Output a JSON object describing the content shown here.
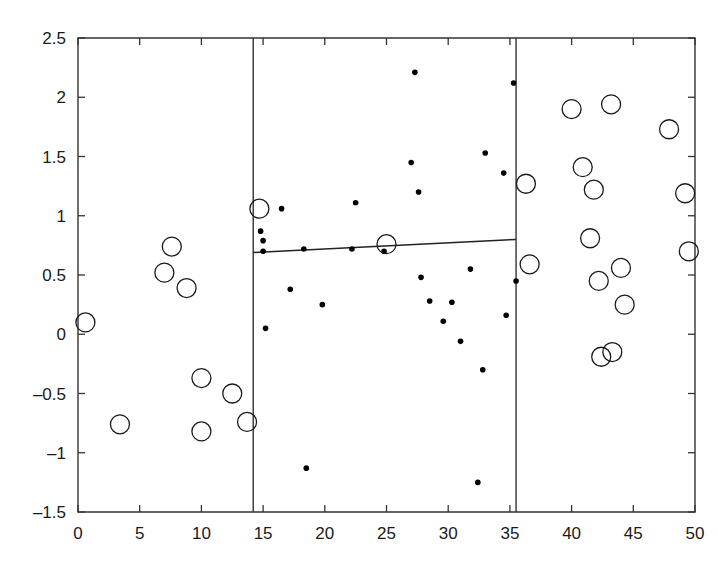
{
  "chart_data": {
    "type": "scatter",
    "title": "",
    "xlabel": "",
    "ylabel": "",
    "xlim": [
      0,
      50
    ],
    "ylim": [
      -1.5,
      2.5
    ],
    "grid": false,
    "legend": null,
    "xticks": [
      0,
      5,
      10,
      15,
      20,
      25,
      30,
      35,
      40,
      45,
      50
    ],
    "xtick_labels": [
      "0",
      "5",
      "10",
      "15",
      "20",
      "25",
      "30",
      "35",
      "40",
      "45",
      "50"
    ],
    "yticks": [
      -1.5,
      -1,
      -0.5,
      0,
      0.5,
      1,
      1.5,
      2,
      2.5
    ],
    "ytick_labels": [
      "-1.5",
      "-1",
      "-0.5",
      "0",
      "0.5",
      "1",
      "1.5",
      "2",
      "2.5"
    ],
    "series": [
      {
        "name": "open-circle-markers",
        "marker": "open-circle",
        "color": "#1a1a1a",
        "points": [
          [
            0.6,
            0.1
          ],
          [
            3.4,
            -0.76
          ],
          [
            7.0,
            0.52
          ],
          [
            7.6,
            0.74
          ],
          [
            8.8,
            0.39
          ],
          [
            10.0,
            -0.37
          ],
          [
            10.0,
            -0.82
          ],
          [
            12.5,
            -0.5
          ],
          [
            13.7,
            -0.74
          ],
          [
            14.7,
            1.06
          ],
          [
            25.0,
            0.76
          ],
          [
            36.3,
            1.27
          ],
          [
            36.6,
            0.59
          ],
          [
            40.0,
            1.9
          ],
          [
            40.9,
            1.41
          ],
          [
            41.5,
            0.81
          ],
          [
            41.8,
            1.22
          ],
          [
            42.2,
            0.45
          ],
          [
            42.4,
            -0.19
          ],
          [
            43.2,
            1.94
          ],
          [
            43.3,
            -0.15
          ],
          [
            44.0,
            0.56
          ],
          [
            44.3,
            0.25
          ],
          [
            47.9,
            1.73
          ],
          [
            49.2,
            1.19
          ],
          [
            49.5,
            0.7
          ]
        ]
      },
      {
        "name": "small-dot-markers",
        "marker": "filled-dot",
        "color": "#000000",
        "points": [
          [
            14.8,
            0.87
          ],
          [
            15.0,
            0.79
          ],
          [
            15.0,
            0.7
          ],
          [
            15.2,
            0.05
          ],
          [
            16.5,
            1.06
          ],
          [
            17.2,
            0.38
          ],
          [
            18.3,
            0.72
          ],
          [
            18.5,
            -1.13
          ],
          [
            19.8,
            0.25
          ],
          [
            22.2,
            0.72
          ],
          [
            22.5,
            1.11
          ],
          [
            24.8,
            0.7
          ],
          [
            27.0,
            1.45
          ],
          [
            27.3,
            2.21
          ],
          [
            27.6,
            1.2
          ],
          [
            27.8,
            0.48
          ],
          [
            28.5,
            0.28
          ],
          [
            29.6,
            0.11
          ],
          [
            30.3,
            0.27
          ],
          [
            31.0,
            -0.06
          ],
          [
            31.8,
            0.55
          ],
          [
            32.4,
            -1.25
          ],
          [
            32.8,
            -0.3
          ],
          [
            33.0,
            1.53
          ],
          [
            34.5,
            1.36
          ],
          [
            34.7,
            0.16
          ],
          [
            35.3,
            2.12
          ],
          [
            35.5,
            0.45
          ]
        ]
      }
    ],
    "annotations": [
      {
        "name": "vertical-split-left",
        "type": "vertical-line",
        "x": 14.2
      },
      {
        "name": "vertical-split-right",
        "type": "vertical-line",
        "x": 35.5
      },
      {
        "name": "regression-line",
        "type": "line-segment",
        "x0": 14.2,
        "y0": 0.69,
        "x1": 35.5,
        "y1": 0.8
      }
    ]
  }
}
